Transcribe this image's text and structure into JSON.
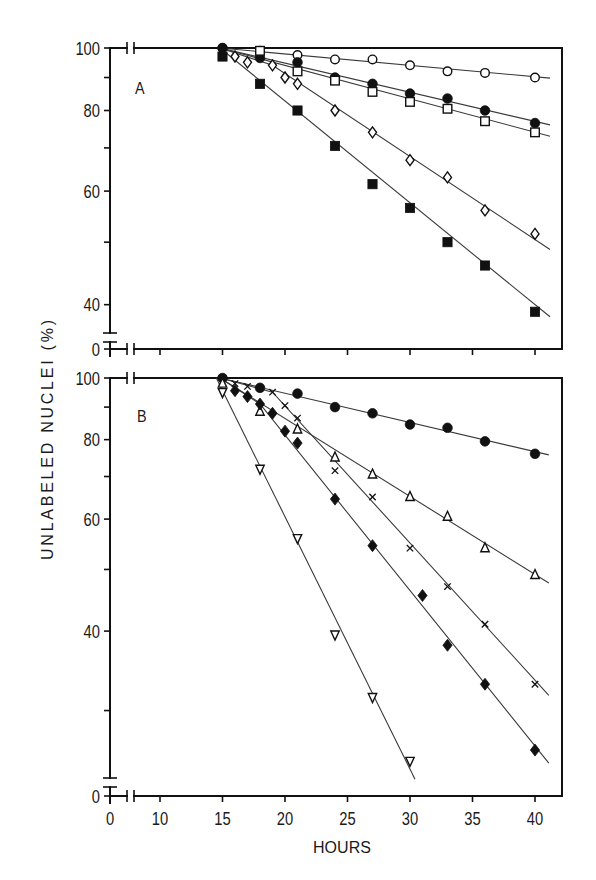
{
  "chart_data": [
    {
      "panel_label": "A",
      "type": "scatter",
      "title": "",
      "xlabel": "HOURS",
      "ylabel": "UNLABELED NUCLEI (%)",
      "xscale": "linear",
      "yscale": "log",
      "x_axis_break": [
        0,
        10
      ],
      "y_axis_break": [
        0,
        38
      ],
      "xlim": [
        0,
        42
      ],
      "ylim": [
        37,
        100
      ],
      "xticks": [
        0,
        10,
        15,
        20,
        25,
        30,
        35,
        40
      ],
      "xticklabels": [],
      "yticks": [
        100,
        80,
        60,
        40
      ],
      "yticks_minor": [
        90,
        70,
        50
      ],
      "y_break_label": "0",
      "grid": false,
      "legend": "none",
      "series": [
        {
          "name": "open circles",
          "marker": "open-circle",
          "x": [
            15,
            18,
            21,
            24,
            27,
            30,
            33,
            36,
            40
          ],
          "y": [
            100,
            99,
            97.5,
            96,
            96,
            94,
            92,
            91.5,
            90
          ],
          "fit": [
            [
              14.8,
              100
            ],
            [
              41.2,
              89.8
            ]
          ]
        },
        {
          "name": "filled circles",
          "marker": "filled-circle",
          "x": [
            15,
            18,
            21,
            24,
            27,
            30,
            33,
            36,
            40
          ],
          "y": [
            100,
            96.5,
            95,
            90,
            88,
            85,
            83.5,
            80,
            76.5
          ],
          "fit": [
            [
              14.8,
              100
            ],
            [
              41.2,
              76
            ]
          ]
        },
        {
          "name": "open squares",
          "marker": "open-square",
          "x": [
            18,
            21,
            24,
            27,
            30,
            33,
            36,
            40
          ],
          "y": [
            99,
            92,
            89,
            85.5,
            82.5,
            80.5,
            77,
            74
          ],
          "fit": [
            [
              14.8,
              100
            ],
            [
              41.2,
              73
            ]
          ]
        },
        {
          "name": "open diamonds",
          "marker": "open-diamond",
          "x": [
            16,
            17,
            19,
            20,
            21,
            24,
            27,
            30,
            33,
            36,
            40
          ],
          "y": [
            97,
            95,
            94,
            90,
            88,
            80,
            74,
            67,
            63,
            56,
            51.5
          ],
          "fit": [
            [
              14.8,
              100
            ],
            [
              19,
              94
            ],
            [
              41.2,
              48.7
            ]
          ]
        },
        {
          "name": "filled squares",
          "marker": "filled-square",
          "x": [
            15,
            18,
            21,
            24,
            27,
            30,
            33,
            36,
            40
          ],
          "y": [
            97,
            88,
            80,
            70.5,
            61.5,
            56.5,
            50,
            46,
            39
          ],
          "fit": [
            [
              14.8,
              100
            ],
            [
              41.2,
              38.3
            ]
          ]
        }
      ]
    },
    {
      "panel_label": "B",
      "type": "scatter",
      "title": "",
      "xlabel": "HOURS",
      "ylabel": "UNLABELED NUCLEI (%)",
      "xscale": "linear",
      "yscale": "log",
      "x_axis_break": [
        0,
        10
      ],
      "y_axis_break": [
        0,
        23
      ],
      "xlim": [
        0,
        42
      ],
      "ylim": [
        23,
        100
      ],
      "xticks": [
        0,
        10,
        15,
        20,
        25,
        30,
        35,
        40
      ],
      "xticklabels": [
        "0",
        "10",
        "15",
        "20",
        "25",
        "30",
        "35",
        "40"
      ],
      "yticks": [
        100,
        80,
        60,
        40
      ],
      "yticks_minor": [
        90,
        70,
        50,
        30
      ],
      "y_break_label": "0",
      "grid": false,
      "legend": "none",
      "series": [
        {
          "name": "filled circles",
          "marker": "filled-circle",
          "x": [
            15,
            18,
            21,
            24,
            27,
            30,
            33,
            36,
            40
          ],
          "y": [
            100,
            96.5,
            94.5,
            90,
            88,
            84.5,
            83.5,
            79.5,
            76
          ],
          "fit": [
            [
              14.8,
              100
            ],
            [
              41.1,
              75.7
            ]
          ]
        },
        {
          "name": "open triangles",
          "marker": "open-triangle",
          "x": [
            15,
            18,
            21,
            24,
            27,
            30,
            33,
            36,
            40
          ],
          "y": [
            98,
            88.5,
            83,
            75,
            70.5,
            65,
            60.5,
            54,
            49
          ],
          "fit": [
            [
              14.8,
              100
            ],
            [
              41.1,
              47.6
            ]
          ]
        },
        {
          "name": "crosses",
          "marker": "cross",
          "x": [
            16,
            17,
            19,
            20,
            21,
            24,
            27,
            30,
            33,
            36,
            40
          ],
          "y": [
            98,
            97,
            95,
            90.5,
            86.5,
            71.5,
            65,
            54,
            47,
            41,
            33
          ],
          "fit": [
            [
              14.8,
              100
            ],
            [
              19,
              95
            ],
            [
              41.1,
              31.7
            ]
          ]
        },
        {
          "name": "filled diamonds",
          "marker": "filled-diamond",
          "x": [
            16,
            17,
            18,
            19,
            20,
            21,
            24,
            27,
            31,
            33,
            36,
            40
          ],
          "y": [
            95.5,
            93.5,
            91,
            88,
            82.5,
            79,
            64.5,
            54.5,
            45.5,
            38,
            33,
            26
          ],
          "fit": [
            [
              14.8,
              100
            ],
            [
              18,
              91
            ],
            [
              41.1,
              24.8
            ]
          ]
        },
        {
          "name": "open inverted triangles",
          "marker": "open-triangle-down",
          "x": [
            15,
            18,
            21,
            24,
            27,
            30
          ],
          "y": [
            95,
            72,
            56,
            39.5,
            31.5,
            25
          ],
          "fit": [
            [
              14.5,
              100
            ],
            [
              30.4,
              23.4
            ]
          ]
        }
      ]
    }
  ]
}
